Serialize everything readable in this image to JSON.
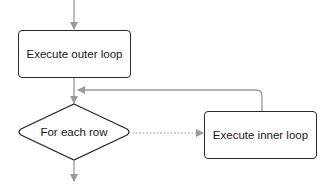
{
  "diagram": {
    "type": "flowchart",
    "nodes": [
      {
        "id": "outer",
        "shape": "rounded-rectangle",
        "label": "Execute outer loop"
      },
      {
        "id": "decision",
        "shape": "diamond",
        "label": "For each row"
      },
      {
        "id": "inner",
        "shape": "rounded-rectangle",
        "label": "Execute inner loop"
      }
    ],
    "edges": [
      {
        "from": "start",
        "to": "outer",
        "style": "solid"
      },
      {
        "from": "outer",
        "to": "decision",
        "style": "solid"
      },
      {
        "from": "decision",
        "to": "inner",
        "style": "dashed"
      },
      {
        "from": "inner",
        "to": "decision",
        "style": "solid",
        "note": "loop back"
      },
      {
        "from": "decision",
        "to": "end",
        "style": "solid"
      }
    ],
    "colors": {
      "node_border": "#2a2a2a",
      "edge": "#9a9a9a",
      "text": "#1a1a1a",
      "background": "#ffffff"
    }
  }
}
